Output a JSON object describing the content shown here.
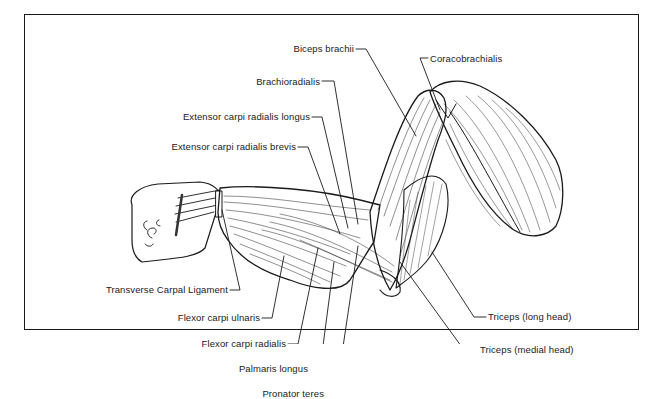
{
  "diagram": {
    "type": "anatomical-illustration",
    "labels": {
      "biceps_brachii": "Biceps brachii",
      "coracobrachialis": "Coracobrachialis",
      "brachioradialis": "Brachioradialis",
      "ecr_longus": "Extensor carpi radialis longus",
      "ecr_brevis": "Extensor carpi radialis brevis",
      "transverse_carpal_ligament": "Transverse Carpal Ligament",
      "flexor_carpi_ulnaris": "Flexor carpi ulnaris",
      "flexor_carpi_radialis": "Flexor carpi radialis",
      "palmaris_longus": "Palmaris longus",
      "pronator_teres": "Pronator teres",
      "triceps_long_head": "Triceps (long head)",
      "triceps_medial_head": "Triceps (medial head)"
    },
    "colors": {
      "ink": "#1a1a1a",
      "background": "#ffffff"
    }
  }
}
